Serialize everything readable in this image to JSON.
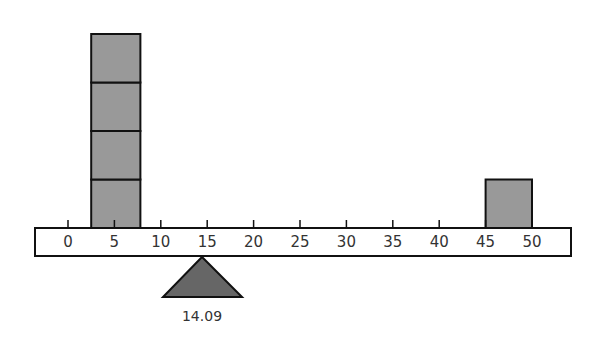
{
  "diagram": {
    "type": "balance-beam",
    "scale": {
      "min": 0,
      "max": 50,
      "step": 5,
      "tick_labels": [
        "0",
        "5",
        "10",
        "15",
        "20",
        "25",
        "30",
        "35",
        "40",
        "45",
        "50"
      ]
    },
    "fulcrum": {
      "position": 14.09,
      "label": "14.09"
    },
    "weights": [
      {
        "name": "left-stack",
        "from": 2.5,
        "to": 7.8,
        "count": 4
      },
      {
        "name": "right-block",
        "from": 45,
        "to": 50,
        "count": 1
      }
    ],
    "colors": {
      "block": "#999999",
      "fulcrum": "#666666",
      "beam": "#ffffff",
      "outline": "#111111"
    }
  }
}
